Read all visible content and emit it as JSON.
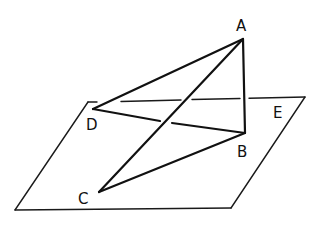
{
  "diagram": {
    "type": "3d-geometry-figure",
    "plane": {
      "label": "E",
      "corners": {
        "top_left": [
          88,
          102
        ],
        "top_right": [
          305,
          97
        ],
        "bottom_right": [
          231,
          208
        ],
        "bottom_left": [
          15,
          210
        ]
      }
    },
    "points": [
      {
        "name": "A",
        "label": "A",
        "x": 243,
        "y": 39,
        "label_x": 236,
        "label_y": 31
      },
      {
        "name": "B",
        "label": "B",
        "x": 245,
        "y": 133,
        "label_x": 237,
        "label_y": 157
      },
      {
        "name": "C",
        "label": "C",
        "x": 99,
        "y": 192,
        "label_x": 78,
        "label_y": 204
      },
      {
        "name": "D",
        "label": "D",
        "x": 93,
        "y": 109,
        "label_x": 86,
        "label_y": 130
      }
    ],
    "segments": [
      "AD",
      "AC",
      "AB",
      "DB",
      "CB"
    ],
    "plane_label": {
      "text": "E",
      "x": 273,
      "y": 118
    }
  }
}
